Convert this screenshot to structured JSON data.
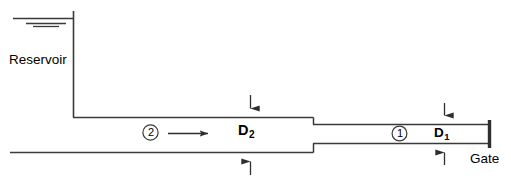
{
  "figure": {
    "type": "engineering-schematic",
    "background_color": "#ffffff",
    "line_color": "#3a3a3a",
    "text_color": "#000000"
  },
  "labels": {
    "reservoir": "Reservoir",
    "gate": "Gate",
    "diameter_upstream": "D",
    "diameter_upstream_sub": "2",
    "diameter_downstream": "D",
    "diameter_downstream_sub": "1"
  },
  "stations": [
    {
      "id": "station-2",
      "number": "2",
      "pipe": "large",
      "label": "D2"
    },
    {
      "id": "station-1",
      "number": "1",
      "pipe": "small",
      "label": "D1"
    }
  ],
  "annotations": {
    "flow_arrow": "flow-direction-arrow",
    "flow_direction": "left-to-right",
    "water_surface_symbol": "free-surface-triple-line",
    "dimension_d2": "inward-pointing-dimension-arrows",
    "dimension_d1": "inward-pointing-dimension-arrows"
  },
  "geometry": {
    "reservoir_wall_x": 73,
    "water_surface_y": 18,
    "large_pipe": {
      "top_y": 117,
      "bottom_y": 152,
      "x_start": 73,
      "x_end": 313
    },
    "small_pipe": {
      "top_y": 124,
      "bottom_y": 143,
      "x_start": 313,
      "x_end": 489
    },
    "gate_x": 489,
    "ground_line_y": 152,
    "ground_line_x_start": 10
  }
}
